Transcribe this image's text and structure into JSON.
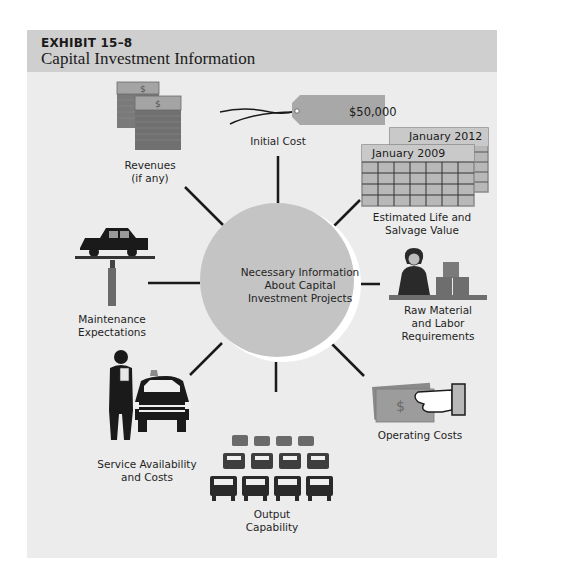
{
  "exhibit": {
    "number": "EXHIBIT 15–8",
    "title": "Capital Investment Information"
  },
  "center": {
    "lines": [
      "Necessary Information",
      "About Capital",
      "Investment Projects"
    ],
    "color": "#c4c4c4"
  },
  "nodes": {
    "initial_cost": {
      "lines": [
        "Initial Cost"
      ],
      "tag_value": "$50,000",
      "icon": "price-tag-icon"
    },
    "revenues": {
      "lines": [
        "Revenues",
        "(if any)"
      ],
      "icon": "money-stacks-icon",
      "bill_symbol": "$"
    },
    "estimated_life": {
      "lines": [
        "Estimated Life and",
        "Salvage Value"
      ],
      "icon": "calendar-icon",
      "calendar_back": "January 2012",
      "calendar_front": "January 2009"
    },
    "maintenance": {
      "lines": [
        "Maintenance",
        "Expectations"
      ],
      "icon": "car-lift-icon"
    },
    "raw_material": {
      "lines": [
        "Raw Material",
        "and Labor",
        "Requirements"
      ],
      "icon": "worker-boxes-icon"
    },
    "service": {
      "lines": [
        "Service Availability",
        "and Costs"
      ],
      "icon": "mechanic-taxi-icon"
    },
    "operating_costs": {
      "lines": [
        "Operating Costs"
      ],
      "icon": "hand-money-icon",
      "bill_symbol": "$"
    },
    "output": {
      "lines": [
        "Output",
        "Capability"
      ],
      "icon": "car-fleet-icon"
    }
  }
}
